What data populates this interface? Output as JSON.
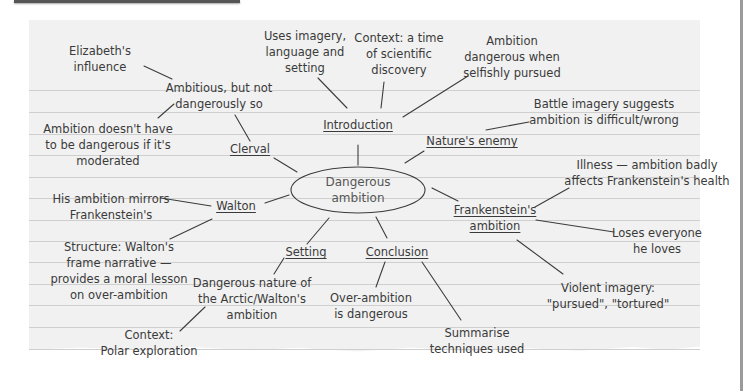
{
  "central_topic": {
    "lines": [
      "Dangerous",
      "ambition"
    ]
  },
  "branches": {
    "introduction": {
      "label": "Introduction",
      "notes": [
        {
          "lines": [
            "Uses imagery,",
            "language and",
            "setting"
          ]
        },
        {
          "lines": [
            "Context: a time",
            "of scientific",
            "discovery"
          ]
        },
        {
          "lines": [
            "Ambition",
            "dangerous when",
            "selfishly pursued"
          ]
        }
      ]
    },
    "natures_enemy": {
      "label": "Nature's enemy",
      "notes": [
        {
          "lines": [
            "Battle imagery suggests",
            "ambition is difficult/wrong"
          ]
        }
      ]
    },
    "frankensteins_ambition": {
      "label_lines": [
        "Frankenstein's",
        "ambition"
      ],
      "notes": [
        {
          "lines": [
            "Illness — ambition badly",
            "affects Frankenstein's health"
          ]
        },
        {
          "lines": [
            "Loses everyone",
            "he loves"
          ]
        },
        {
          "lines": [
            "Violent imagery:",
            "\"pursued\", \"tortured\""
          ]
        }
      ]
    },
    "conclusion": {
      "label": "Conclusion",
      "notes": [
        {
          "lines": [
            "Over-ambition",
            "is dangerous"
          ]
        },
        {
          "lines": [
            "Summarise",
            "techniques used"
          ]
        }
      ]
    },
    "setting": {
      "label": "Setting",
      "notes": [
        {
          "lines": [
            "Dangerous nature of",
            "the Arctic/Walton's",
            "ambition"
          ]
        },
        {
          "lines": [
            "Context:",
            "Polar exploration"
          ]
        }
      ]
    },
    "walton": {
      "label": "Walton",
      "notes": [
        {
          "lines": [
            "His ambition mirrors",
            "Frankenstein's"
          ]
        },
        {
          "lines": [
            "Structure: Walton's",
            "frame narrative —",
            "provides a moral lesson",
            "on over-ambition"
          ]
        }
      ]
    },
    "clerval": {
      "label": "Clerval",
      "notes": [
        {
          "lines": [
            "Ambitious, but not",
            "dangerously so"
          ]
        },
        {
          "lines": [
            "Elizabeth's",
            "influence"
          ]
        },
        {
          "lines": [
            "Ambition doesn't have",
            "to be dangerous if it's",
            "moderated"
          ]
        }
      ]
    }
  },
  "background_ghost_text": "Always keep n",
  "colors": {
    "paper": "#f1f1f1",
    "rule_line": "#cfcfcf",
    "ink": "#3a3a3a",
    "connector": "#3c3c3c"
  }
}
